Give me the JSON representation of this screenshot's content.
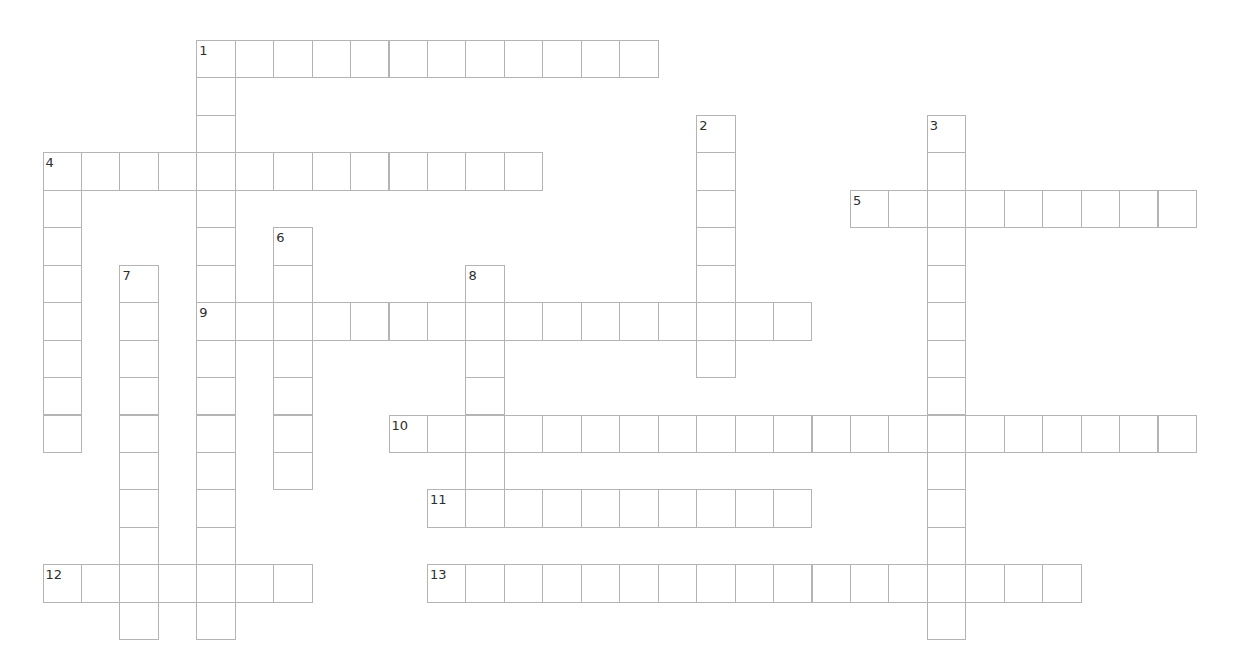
{
  "puzzle": {
    "grid": {
      "origin_x": 42.5,
      "origin_y": 40,
      "cell_w": 38.45,
      "cell_h": 37.45,
      "border_color": "#b4b4b4",
      "label_color": "#2e2e2e"
    },
    "across": [
      {
        "number": "1",
        "row": 0,
        "col": 4,
        "length": 12
      },
      {
        "number": "4",
        "row": 3,
        "col": 0,
        "length": 13
      },
      {
        "number": "5",
        "row": 4,
        "col": 21,
        "length": 9
      },
      {
        "number": "9",
        "row": 7,
        "col": 4,
        "length": 16
      },
      {
        "number": "10",
        "row": 10,
        "col": 9,
        "length": 21
      },
      {
        "number": "11",
        "row": 12,
        "col": 10,
        "length": 10
      },
      {
        "number": "12",
        "row": 14,
        "col": 0,
        "length": 7
      },
      {
        "number": "13",
        "row": 14,
        "col": 10,
        "length": 17
      }
    ],
    "down": [
      {
        "number": "1",
        "row": 0,
        "col": 4,
        "length": 16
      },
      {
        "number": "2",
        "row": 2,
        "col": 17,
        "length": 7
      },
      {
        "number": "3",
        "row": 2,
        "col": 23,
        "length": 14
      },
      {
        "number": "4",
        "row": 3,
        "col": 0,
        "length": 8
      },
      {
        "number": "6",
        "row": 5,
        "col": 6,
        "length": 7
      },
      {
        "number": "7",
        "row": 6,
        "col": 2,
        "length": 10
      },
      {
        "number": "8",
        "row": 6,
        "col": 11,
        "length": 7
      }
    ]
  }
}
